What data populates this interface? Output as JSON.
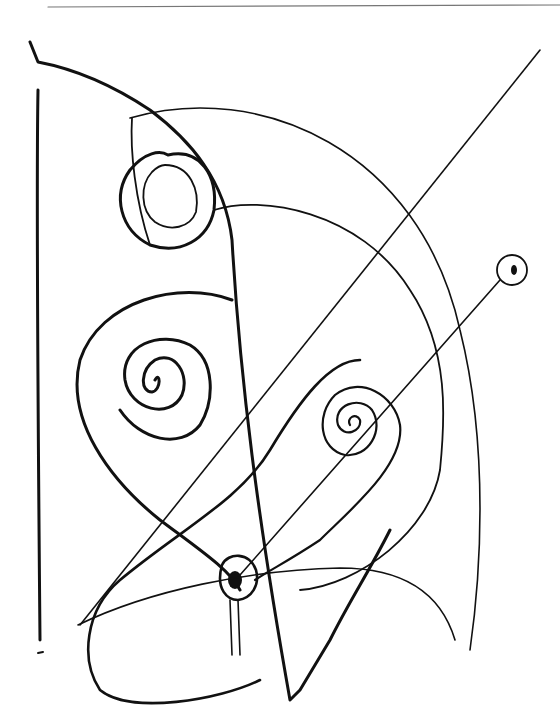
{
  "drawing": {
    "kind": "abstract line sketch",
    "ink_color": "#111111",
    "background": "#ffffff",
    "elements": [
      "top-rule",
      "tall-quad-frame",
      "open-circle-spiral",
      "left-spiral",
      "right-spiral",
      "small-dot-circle",
      "heart-knot",
      "quarter-arc",
      "diagonal-line",
      "bottom-loop"
    ]
  }
}
